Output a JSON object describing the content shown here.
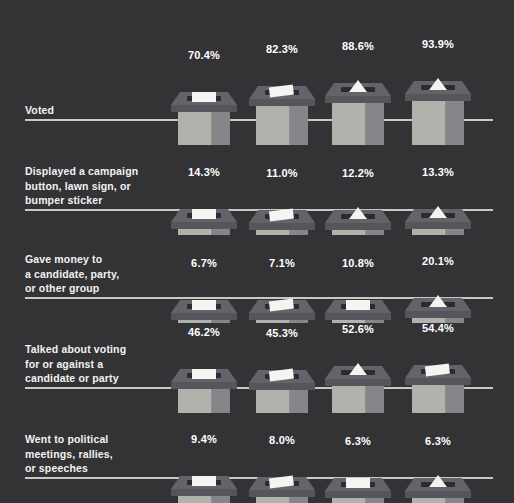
{
  "chart_data": {
    "type": "bar",
    "title": "",
    "subtitle": "",
    "xlabel": "",
    "ylabel": "",
    "legend_position": "none",
    "grid": false,
    "value_suffix": "%",
    "categories": [
      "Voted",
      "Displayed a campaign button, lawn sign, or bumper sticker",
      "Gave money to a candidate, party, or other group",
      "Talked about voting for or against a candidate or party",
      "Went to political meetings, rallies, or speeches"
    ],
    "series": [
      {
        "name": "Group 1",
        "values": [
          70.4,
          14.3,
          6.7,
          46.2,
          9.4
        ]
      },
      {
        "name": "Group 2",
        "values": [
          82.3,
          11.0,
          7.1,
          45.3,
          8.0
        ]
      },
      {
        "name": "Group 3",
        "values": [
          88.6,
          12.2,
          10.8,
          52.6,
          6.3
        ]
      },
      {
        "name": "Group 4",
        "values": [
          93.9,
          13.3,
          20.1,
          54.4,
          6.3
        ]
      }
    ],
    "ylim": [
      0,
      100
    ]
  },
  "colors": {
    "background": "#333336",
    "baseline": "#c9c9c4",
    "label_text": "#f2f2f2",
    "value_text": "#ffffff",
    "box_body": "#b2b2ad",
    "box_body_shade": "#86868a",
    "box_lid_top": "#63636a",
    "box_lid_face": "#55555c",
    "slot": "#2b2b30",
    "ballot_paper": "#f4f4f0"
  },
  "rows": [
    {
      "label": "Voted",
      "label_lines": "Voted",
      "bars": [
        {
          "value_label": "70.4%",
          "value": 70.4,
          "ballot_style": "rect"
        },
        {
          "value_label": "82.3%",
          "value": 82.3,
          "ballot_style": "rect-tilt"
        },
        {
          "value_label": "88.6%",
          "value": 88.6,
          "ballot_style": "triangle"
        },
        {
          "value_label": "93.9%",
          "value": 93.9,
          "ballot_style": "triangle"
        }
      ]
    },
    {
      "label": "Displayed a campaign button, lawn sign, or bumper sticker",
      "label_lines": "Displayed a campaign\nbutton, lawn sign, or\nbumper sticker",
      "bars": [
        {
          "value_label": "14.3%",
          "value": 14.3,
          "ballot_style": "rect"
        },
        {
          "value_label": "11.0%",
          "value": 11.0,
          "ballot_style": "rect-tilt"
        },
        {
          "value_label": "12.2%",
          "value": 12.2,
          "ballot_style": "triangle"
        },
        {
          "value_label": "13.3%",
          "value": 13.3,
          "ballot_style": "triangle"
        }
      ]
    },
    {
      "label": "Gave money to a candidate, party, or other group",
      "label_lines": "Gave money to\na candidate, party,\nor other group",
      "bars": [
        {
          "value_label": "6.7%",
          "value": 6.7,
          "ballot_style": "rect"
        },
        {
          "value_label": "7.1%",
          "value": 7.1,
          "ballot_style": "rect-tilt"
        },
        {
          "value_label": "10.8%",
          "value": 10.8,
          "ballot_style": "rect"
        },
        {
          "value_label": "20.1%",
          "value": 20.1,
          "ballot_style": "triangle"
        }
      ]
    },
    {
      "label": "Talked about voting for or against a candidate or party",
      "label_lines": "Talked about voting\nfor or against a\ncandidate or party",
      "bars": [
        {
          "value_label": "46.2%",
          "value": 46.2,
          "ballot_style": "rect"
        },
        {
          "value_label": "45.3%",
          "value": 45.3,
          "ballot_style": "rect-tilt"
        },
        {
          "value_label": "52.6%",
          "value": 52.6,
          "ballot_style": "triangle"
        },
        {
          "value_label": "54.4%",
          "value": 54.4,
          "ballot_style": "rect-tilt"
        }
      ]
    },
    {
      "label": "Went to political meetings, rallies, or speeches",
      "label_lines": "Went to political\nmeetings, rallies,\nor speeches",
      "bars": [
        {
          "value_label": "9.4%",
          "value": 9.4,
          "ballot_style": "rect"
        },
        {
          "value_label": "8.0%",
          "value": 8.0,
          "ballot_style": "rect-tilt"
        },
        {
          "value_label": "6.3%",
          "value": 6.3,
          "ballot_style": "rect"
        },
        {
          "value_label": "6.3%",
          "value": 6.3,
          "ballot_style": "triangle"
        }
      ]
    }
  ]
}
